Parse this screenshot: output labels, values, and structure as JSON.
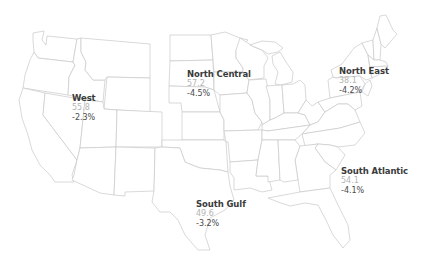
{
  "map": {
    "type": "us-regions",
    "colors": {
      "border": "#c8c8c8",
      "fill": "#ffffff",
      "name_text": "#3a3a3a",
      "value_text": "#b4b4b4",
      "change_text": "#4a4a4a"
    },
    "regions": [
      {
        "name": "West",
        "value": "55.8",
        "change": "-2.3%"
      },
      {
        "name": "North Central",
        "value": "57.2",
        "change": "-4.5%"
      },
      {
        "name": "North East",
        "value": "38.1",
        "change": "-4.2%"
      },
      {
        "name": "South Atlantic",
        "value": "54.1",
        "change": "-4.1%"
      },
      {
        "name": "South Gulf",
        "value": "49.6",
        "change": "-3.2%"
      }
    ]
  }
}
